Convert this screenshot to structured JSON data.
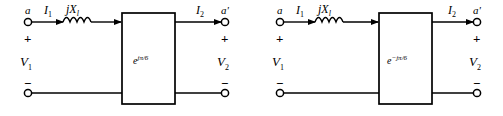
{
  "figure": {
    "background_color": "#ffffff",
    "line_color": "#000000"
  },
  "circuits": [
    {
      "id": "left",
      "terminal_in_label": "a",
      "terminal_out_label": "a'",
      "current_in": "I",
      "current_in_sub": "1",
      "current_out": "I",
      "current_out_sub": "2",
      "inductor_label": "jX",
      "inductor_label_sub": "l",
      "voltage_in": "V",
      "voltage_in_sub": "1",
      "voltage_out": "V",
      "voltage_out_sub": "2",
      "plus_in": "+",
      "minus_in": "−",
      "plus_out": "+",
      "minus_out": "−",
      "box_base": "e",
      "box_exponent": "jπ/6",
      "box_label_full": "e^{jπ/6}"
    },
    {
      "id": "right",
      "terminal_in_label": "a",
      "terminal_out_label": "a'",
      "current_in": "I",
      "current_in_sub": "1",
      "current_out": "I",
      "current_out_sub": "2",
      "inductor_label": "jX",
      "inductor_label_sub": "l",
      "voltage_in": "V",
      "voltage_in_sub": "1",
      "voltage_out": "V",
      "voltage_out_sub": "2",
      "plus_in": "+",
      "minus_in": "−",
      "plus_out": "+",
      "minus_out": "−",
      "box_base": "e",
      "box_exponent": "−jπ/6",
      "box_label_full": "e^{-jπ/6}"
    }
  ]
}
